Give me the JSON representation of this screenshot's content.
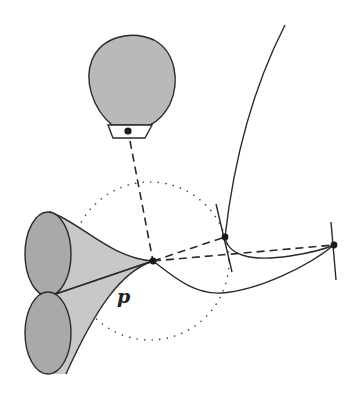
{
  "figure": {
    "type": "geometric diagram",
    "labels": {
      "point_label": "p"
    },
    "colors": {
      "stroke": "#2a2a2a",
      "balloon_fill": "#b9b9b9",
      "ellipse_fill": "#a9a9a9",
      "cone_fill": "#c8c8c8",
      "background": "#ffffff"
    },
    "points": [
      {
        "name": "p",
        "x": 153,
        "y": 261
      },
      {
        "name": "middle-point",
        "x": 225,
        "y": 237
      },
      {
        "name": "right-point",
        "x": 334,
        "y": 245
      },
      {
        "name": "camera-center",
        "x": 128,
        "y": 131
      }
    ],
    "dotted_circle": {
      "cx": 150,
      "cy": 261,
      "r": 79
    }
  }
}
